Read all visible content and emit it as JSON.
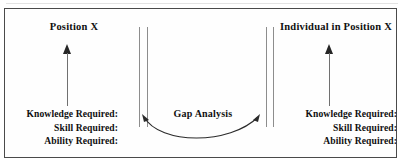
{
  "diagram": {
    "title_left": "Position X",
    "title_right": "Individual in Position X",
    "center_label": "Gap Analysis",
    "left_requirements": {
      "line1": "Knowledge Required:",
      "line2": "Skill Required:",
      "line3": "Ability Required:"
    },
    "right_requirements": {
      "line1": "Knowledge Required:",
      "line2": "Skill Required:",
      "line3": "Ability Required:"
    },
    "colors": {
      "border": "#4a4a4a",
      "text": "#101010",
      "divider": "#8d8d8d",
      "arrow": "#262626",
      "arrow_shaft": "#707070",
      "background": "#fefefe"
    },
    "icons": {
      "left_up_arrow": "arrow-up-icon",
      "right_up_arrow": "arrow-up-icon",
      "gap_arrow": "double-headed-curved-arrow-icon"
    }
  }
}
